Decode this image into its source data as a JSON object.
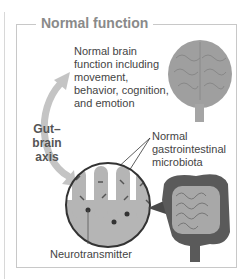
{
  "figure": {
    "title": "Normal function",
    "brain_caption": "Normal brain function including movement, behavior, cognition, and emotion",
    "axis_label_line1": "Gut–brain",
    "axis_label_line2": "axis",
    "microbiota_caption": "Normal gastrointestinal microbiota",
    "neurotransmitter_label": "Neurotransmitter"
  },
  "colors": {
    "frame": "#c8c8c8",
    "title": "#8a8a8a",
    "brain": "#9a9a9a",
    "arrow": "#c4c4c4",
    "colon": "#5a5a5a",
    "small_intestine": "#a8a8a8",
    "villi": "#b5b5b5"
  }
}
